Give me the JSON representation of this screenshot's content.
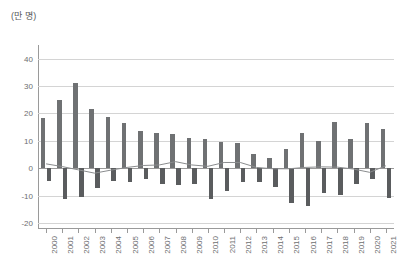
{
  "chart_data": {
    "type": "bar",
    "title": "(만 명)",
    "xlabel": "",
    "ylabel": "(만 명)",
    "ylim": [
      -20,
      45
    ],
    "yticks": [
      40,
      30,
      20,
      10,
      0,
      -10,
      -20
    ],
    "ytick_labels": [
      "40",
      "30",
      "20",
      "10",
      "0",
      "-10",
      "-20"
    ],
    "grid": true,
    "legend_position": "none",
    "categories": [
      "2000",
      "2001",
      "2002",
      "2003",
      "2004",
      "2005",
      "2006",
      "2007",
      "2008",
      "2009",
      "2010",
      "2011",
      "2012",
      "2013",
      "2014",
      "2015",
      "2016",
      "2017",
      "2018",
      "2019",
      "2020",
      "2021"
    ],
    "series": [
      {
        "name": "positive-bars",
        "type": "bar",
        "values": [
          18.3,
          24.8,
          31.2,
          21.7,
          18.7,
          16.4,
          13.7,
          13.0,
          12.4,
          11.0,
          10.8,
          9.6,
          9.3,
          5.3,
          3.6,
          7.1,
          12.8,
          9.8,
          16.7,
          10.6,
          16.5,
          14.5
        ]
      },
      {
        "name": "negative-bars",
        "type": "bar",
        "values": [
          -4.7,
          -11.4,
          -10.6,
          -7.2,
          -4.5,
          -5.0,
          -3.8,
          -5.8,
          -6.0,
          -5.9,
          -11.3,
          -8.3,
          -5.2,
          -4.9,
          -6.9,
          -12.8,
          -13.9,
          -9.1,
          -9.9,
          -5.7,
          -3.8,
          -10.7
        ]
      },
      {
        "name": "net-line",
        "type": "line",
        "values": [
          1.6,
          0.6,
          -0.6,
          -1.8,
          -0.7,
          0.3,
          1.0,
          1.2,
          2.4,
          1.2,
          0.7,
          2.1,
          2.1,
          0.3,
          -0.2,
          -0.2,
          0.3,
          0.5,
          0.4,
          -0.3,
          -1.5,
          0.9
        ]
      }
    ],
    "colors": {
      "positive_bar": "#6f7173",
      "negative_bar": "#5a5c5e",
      "line": "#8a8c8e",
      "gridline": "#d4d4d4",
      "axis": "#9a9a9a",
      "text": "#6d6e70",
      "background": "#ffffff"
    }
  }
}
